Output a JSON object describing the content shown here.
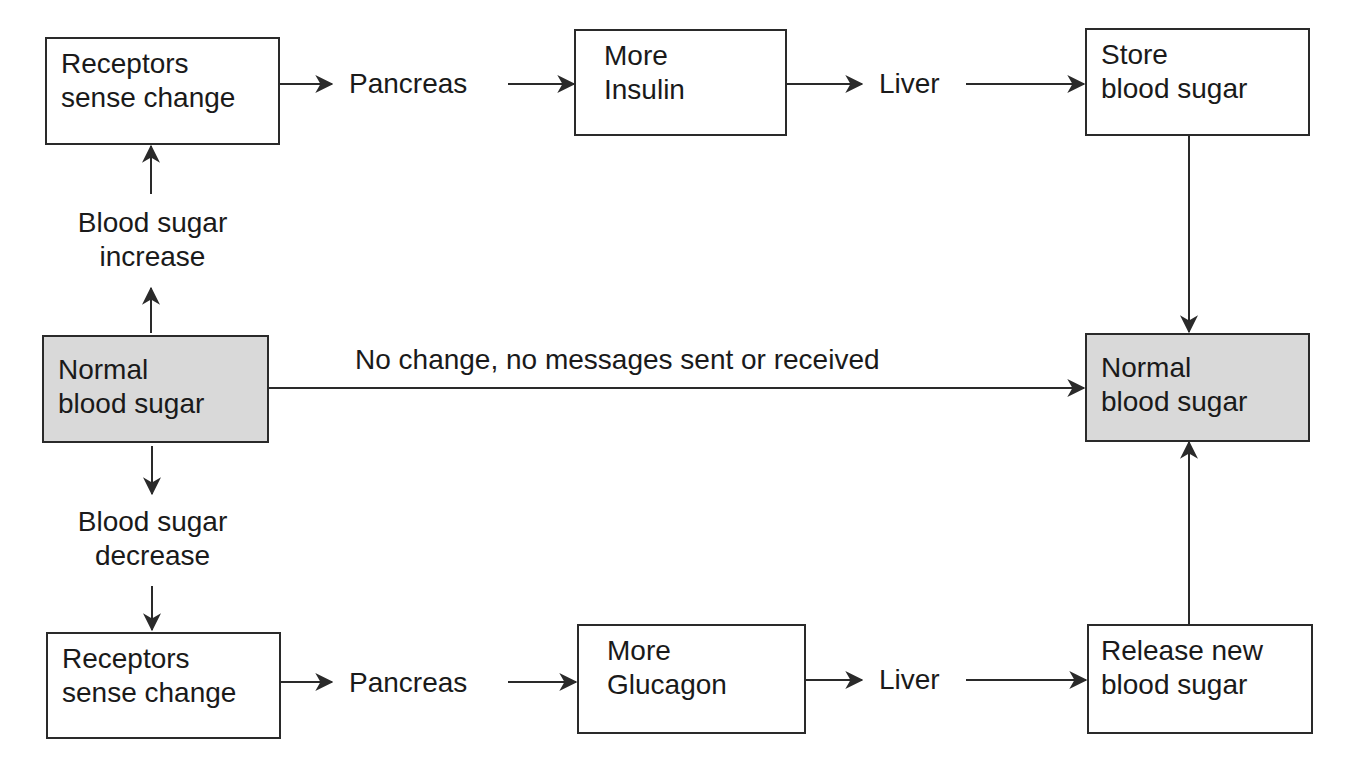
{
  "diagram": {
    "colors": {
      "line": "#2a2a2a",
      "shaded_box": "#d9d9d9",
      "background": "#ffffff"
    },
    "top_row": {
      "receptors": {
        "line1": "Receptors",
        "line2": "sense change"
      },
      "pancreas": "Pancreas",
      "hormone": {
        "line1": "More",
        "line2": "Insulin"
      },
      "liver": "Liver",
      "result": {
        "line1": "Store",
        "line2": "blood sugar"
      }
    },
    "left_column": {
      "increase": {
        "line1": "Blood sugar",
        "line2": "increase"
      },
      "normal": {
        "line1": "Normal",
        "line2": "blood sugar"
      },
      "decrease": {
        "line1": "Blood sugar",
        "line2": "decrease"
      }
    },
    "middle": {
      "no_change": "No change, no messages sent or received"
    },
    "right_normal": {
      "line1": "Normal",
      "line2": "blood sugar"
    },
    "bottom_row": {
      "receptors": {
        "line1": "Receptors",
        "line2": "sense change"
      },
      "pancreas": "Pancreas",
      "hormone": {
        "line1": "More",
        "line2": "Glucagon"
      },
      "liver": "Liver",
      "result": {
        "line1": "Release new",
        "line2": "blood sugar"
      }
    }
  }
}
